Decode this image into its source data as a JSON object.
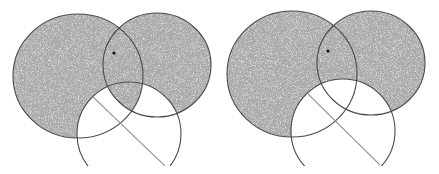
{
  "figures": [
    {
      "id": "left-figure",
      "description": "Two overlapping shaded (stippled gray) circles with a third unshaded circle overlapping below; a chord line and a point marked in the upper lens",
      "shaded_circles": [
        "circle-a",
        "circle-b"
      ],
      "unshaded_circles": [
        "circle-c"
      ],
      "has_marked_point": true,
      "has_line": true
    },
    {
      "id": "right-figure",
      "description": "Same construction as left figure, slightly shifted",
      "shaded_circles": [
        "circle-a",
        "circle-b"
      ],
      "unshaded_circles": [
        "circle-c"
      ],
      "has_marked_point": true,
      "has_line": true
    }
  ],
  "colors": {
    "shade": "#a9a9a9",
    "shade_speckle": "#d4d4d4",
    "stroke": "#4a4a4a",
    "line": "#9a9a9a",
    "point": "#111111",
    "background": "#ffffff"
  }
}
